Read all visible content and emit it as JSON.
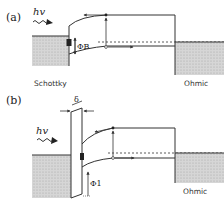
{
  "panels": [
    {
      "id": "a",
      "label": "(a)",
      "photon": "hv",
      "barrier_symbol": "ΦB",
      "left_contact": "Schottky",
      "right_contact": "Ohmic"
    },
    {
      "id": "b",
      "label": "(b)",
      "photon": "hv",
      "barrier_symbol": "Φ1",
      "insulator_symbol": "δ",
      "right_contact": "Ohmic"
    }
  ],
  "colors": {
    "line": "#333333",
    "metal_fill": "#c8c8c8"
  }
}
